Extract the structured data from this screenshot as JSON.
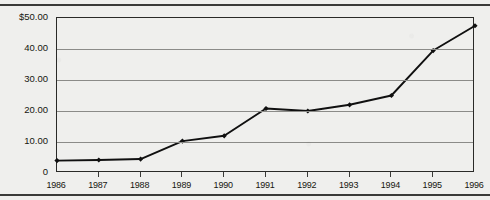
{
  "chart_data": {
    "type": "line",
    "title": "",
    "xlabel": "",
    "ylabel": "",
    "categories": [
      "1986",
      "1987",
      "1988",
      "1989",
      "1990",
      "1991",
      "1992",
      "1993",
      "1994",
      "1995",
      "1996"
    ],
    "values": [
      4.0,
      4.2,
      4.5,
      10.3,
      12.0,
      20.8,
      20.0,
      22.0,
      25.0,
      39.5,
      47.5
    ],
    "series": [
      {
        "name": "",
        "values": [
          4.0,
          4.2,
          4.5,
          10.3,
          12.0,
          20.8,
          20.0,
          22.0,
          25.0,
          39.5,
          47.5
        ]
      }
    ],
    "ylim": [
      0,
      50
    ],
    "yticks": [
      0,
      10,
      20,
      30,
      40,
      50
    ],
    "ytick_labels": [
      "0",
      "10.00",
      "20.00",
      "30.00",
      "40.00",
      "$50.00"
    ],
    "xtick_labels": [
      "1986",
      "1987",
      "1988",
      "1989",
      "1990",
      "1991",
      "1992",
      "1993",
      "1994",
      "1995",
      "1996"
    ],
    "grid": true,
    "legend": "none",
    "marker": "filled-diamond",
    "line_color": "#101010",
    "grid_color": "#8b8b88",
    "axis_color": "#2a2a28",
    "background_color": "#efefed"
  }
}
